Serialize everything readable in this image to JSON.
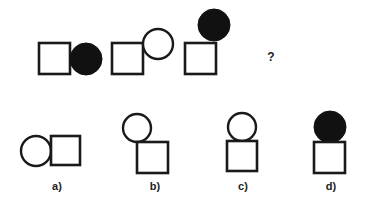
{
  "puzzle": {
    "question_mark": "?",
    "sequence": [
      {
        "square": {
          "x": 39,
          "y": 43,
          "size": 31
        },
        "circle": {
          "cx": 86,
          "cy": 59,
          "r": 16,
          "filled": true
        }
      },
      {
        "square": {
          "x": 112,
          "y": 43,
          "size": 31
        },
        "circle": {
          "cx": 158,
          "cy": 44,
          "r": 15,
          "filled": false
        }
      },
      {
        "square": {
          "x": 185,
          "y": 43,
          "size": 31
        },
        "circle": {
          "cx": 214,
          "cy": 25,
          "r": 16,
          "filled": true
        }
      }
    ],
    "options": [
      {
        "label": "a)",
        "square": {
          "x": 51,
          "y": 136,
          "size": 29
        },
        "circle": {
          "cx": 36,
          "cy": 151,
          "r": 15,
          "filled": false
        }
      },
      {
        "label": "b)",
        "square": {
          "x": 137,
          "y": 142,
          "size": 31
        },
        "circle": {
          "cx": 137,
          "cy": 128,
          "r": 14,
          "filled": false
        }
      },
      {
        "label": "c)",
        "square": {
          "x": 227,
          "y": 141,
          "size": 30
        },
        "circle": {
          "cx": 242,
          "cy": 127,
          "r": 14,
          "filled": false
        }
      },
      {
        "label": "d)",
        "square": {
          "x": 314,
          "y": 142,
          "size": 31
        },
        "circle": {
          "cx": 330,
          "cy": 127,
          "r": 16,
          "filled": true
        }
      }
    ]
  },
  "colors": {
    "stroke": "#1a1a1a",
    "fill": "#111111",
    "background": "#ffffff"
  }
}
